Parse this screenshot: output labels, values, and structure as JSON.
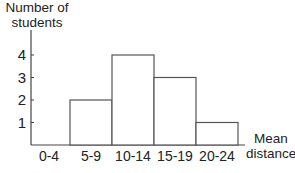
{
  "chart_data": {
    "type": "bar",
    "subtype": "histogram",
    "title": "",
    "xlabel": "Mean distance",
    "ylabel": "Number of students",
    "categories": [
      "0-4",
      "5-9",
      "10-14",
      "15-19",
      "20-24"
    ],
    "values": [
      0,
      2,
      4,
      3,
      1
    ],
    "yticks": [
      1,
      2,
      3,
      4
    ],
    "ylim": [
      0,
      4
    ],
    "grid": false,
    "legend": null
  },
  "labels": {
    "ylabel_line1": "Number of",
    "ylabel_line2": "students",
    "xlabel_line1": "Mean",
    "xlabel_line2": "distance"
  },
  "colors": {
    "axis": "#444444",
    "bar_outline": "#555555",
    "bar_fill": "#ffffff"
  }
}
